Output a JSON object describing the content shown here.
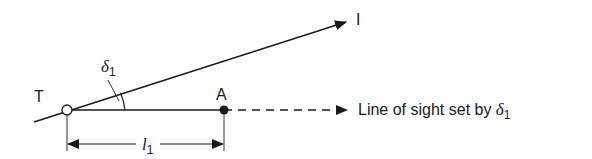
{
  "diagram": {
    "points": {
      "T": {
        "label": "T",
        "marker": "open-circle"
      },
      "A": {
        "label": "A",
        "marker": "filled-circle"
      }
    },
    "inclined_ray": {
      "label": "I"
    },
    "angle": {
      "symbol": "δ",
      "subscript": "1"
    },
    "distance": {
      "symbol": "l",
      "subscript": "1"
    },
    "line_of_sight": {
      "text": "Line of sight set by ",
      "symbol": "δ",
      "subscript": "1"
    },
    "colors": {
      "stroke": "#1a1a1a",
      "background": "#ffffff"
    }
  }
}
